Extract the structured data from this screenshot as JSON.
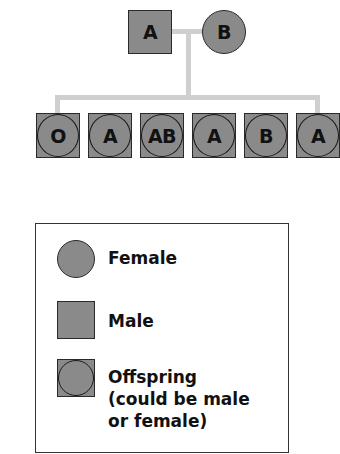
{
  "parents": {
    "father": {
      "shape": "square",
      "blood_type": "A"
    },
    "mother": {
      "shape": "circle",
      "blood_type": "B"
    }
  },
  "offspring": [
    {
      "blood_type": "O"
    },
    {
      "blood_type": "A"
    },
    {
      "blood_type": "AB"
    },
    {
      "blood_type": "A"
    },
    {
      "blood_type": "B"
    },
    {
      "blood_type": "A"
    }
  ],
  "legend": {
    "female": "Female",
    "male": "Male",
    "offspring_line1": "Offspring",
    "offspring_line2": "(could be male",
    "offspring_line3": "or female)"
  },
  "colors": {
    "symbol_fill": "#8a8a8a",
    "outline": "#2a2a2a",
    "connector": "#cfcfcf"
  }
}
